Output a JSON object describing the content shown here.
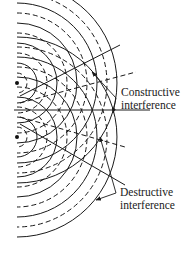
{
  "diagram": {
    "sources": [
      {
        "name": "source-top",
        "x": 17,
        "y": 83
      },
      {
        "name": "source-bottom",
        "x": 17,
        "y": 137
      }
    ],
    "wave": {
      "spacing_px": 10,
      "crest_style": "solid",
      "trough_style": "dashed",
      "rings": [
        10,
        20,
        30,
        40,
        50,
        60,
        70,
        80,
        90,
        100
      ]
    },
    "labels": {
      "constructive_line1": "Constructive",
      "constructive_line2": "interference",
      "destructive_line1": "Destructive",
      "destructive_line2": "interference"
    },
    "colors": {
      "ink": "#1a1a1a",
      "background": "#ffffff"
    }
  }
}
